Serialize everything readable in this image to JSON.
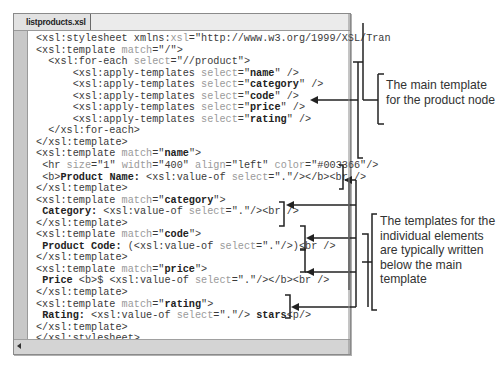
{
  "window": {
    "tab_label": "listproducts.xsl"
  },
  "code_lines": [
    {
      "indent": 0,
      "parts": [
        [
          "t",
          "<xsl:stylesheet xmlns:"
        ],
        [
          "a",
          "xsl"
        ],
        [
          "t",
          "=\"http://www.w3.org/1999/XSL/Tran"
        ]
      ]
    },
    {
      "indent": 0,
      "parts": [
        [
          "t",
          "<xsl:template "
        ],
        [
          "a",
          "match"
        ],
        [
          "t",
          "=\"/\">"
        ]
      ]
    },
    {
      "indent": 2,
      "parts": [
        [
          "t",
          "<xsl:for-each "
        ],
        [
          "a",
          "select"
        ],
        [
          "t",
          "=\"//product\">"
        ]
      ]
    },
    {
      "indent": 6,
      "parts": [
        [
          "t",
          "<xsl:apply-templates "
        ],
        [
          "a",
          "select"
        ],
        [
          "t",
          "=\""
        ],
        [
          "b",
          "name"
        ],
        [
          "t",
          "\" />"
        ]
      ]
    },
    {
      "indent": 6,
      "parts": [
        [
          "t",
          "<xsl:apply-templates "
        ],
        [
          "a",
          "select"
        ],
        [
          "t",
          "=\""
        ],
        [
          "b",
          "category"
        ],
        [
          "t",
          "\" />"
        ]
      ]
    },
    {
      "indent": 6,
      "parts": [
        [
          "t",
          "<xsl:apply-templates "
        ],
        [
          "a",
          "select"
        ],
        [
          "t",
          "=\""
        ],
        [
          "b",
          "code"
        ],
        [
          "t",
          "\" />"
        ]
      ]
    },
    {
      "indent": 6,
      "parts": [
        [
          "t",
          "<xsl:apply-templates "
        ],
        [
          "a",
          "select"
        ],
        [
          "t",
          "=\""
        ],
        [
          "b",
          "price"
        ],
        [
          "t",
          "\" />"
        ]
      ]
    },
    {
      "indent": 6,
      "parts": [
        [
          "t",
          "<xsl:apply-templates "
        ],
        [
          "a",
          "select"
        ],
        [
          "t",
          "=\""
        ],
        [
          "b",
          "rating"
        ],
        [
          "t",
          "\" />"
        ]
      ]
    },
    {
      "indent": 2,
      "parts": [
        [
          "t",
          "</xsl:for-each>"
        ]
      ]
    },
    {
      "indent": 0,
      "parts": [
        [
          "t",
          "</xsl:template>"
        ]
      ]
    },
    {
      "indent": 0,
      "parts": [
        [
          "t",
          "<xsl:template "
        ],
        [
          "a",
          "match"
        ],
        [
          "t",
          "=\""
        ],
        [
          "b",
          "name"
        ],
        [
          "t",
          "\">"
        ]
      ]
    },
    {
      "indent": 1,
      "parts": [
        [
          "t",
          "<hr "
        ],
        [
          "a",
          "size"
        ],
        [
          "t",
          "=\"1\" "
        ],
        [
          "a",
          "width"
        ],
        [
          "t",
          "=\"400\" "
        ],
        [
          "a",
          "align"
        ],
        [
          "t",
          "=\"left\" "
        ],
        [
          "a",
          "color"
        ],
        [
          "t",
          "=\"#003366\"/>"
        ]
      ]
    },
    {
      "indent": 1,
      "parts": [
        [
          "t",
          "<b>"
        ],
        [
          "b",
          "Product Name: "
        ],
        [
          "t",
          "<xsl:value-of "
        ],
        [
          "a",
          "select"
        ],
        [
          "t",
          "=\".\"/></b><br />"
        ]
      ]
    },
    {
      "indent": 0,
      "parts": [
        [
          "t",
          "</xsl:template>"
        ]
      ]
    },
    {
      "indent": 0,
      "parts": [
        [
          "t",
          "<xsl:template "
        ],
        [
          "a",
          "match"
        ],
        [
          "t",
          "=\""
        ],
        [
          "b",
          "category"
        ],
        [
          "t",
          "\">"
        ]
      ]
    },
    {
      "indent": 1,
      "parts": [
        [
          "b",
          "Category: "
        ],
        [
          "t",
          "<xsl:value-of "
        ],
        [
          "a",
          "select"
        ],
        [
          "t",
          "=\".\"/><br />"
        ]
      ]
    },
    {
      "indent": 0,
      "parts": [
        [
          "t",
          "</xsl:template>"
        ]
      ]
    },
    {
      "indent": 0,
      "parts": [
        [
          "t",
          "<xsl:template "
        ],
        [
          "a",
          "match"
        ],
        [
          "t",
          "=\""
        ],
        [
          "b",
          "code"
        ],
        [
          "t",
          "\">"
        ]
      ]
    },
    {
      "indent": 1,
      "parts": [
        [
          "b",
          "Product Code: "
        ],
        [
          "t",
          "(<xsl:value-of "
        ],
        [
          "a",
          "select"
        ],
        [
          "t",
          "=\".\"/>)<br />"
        ]
      ]
    },
    {
      "indent": 0,
      "parts": [
        [
          "t",
          "</xsl:template>"
        ]
      ]
    },
    {
      "indent": 0,
      "parts": [
        [
          "t",
          "<xsl:template "
        ],
        [
          "a",
          "match"
        ],
        [
          "t",
          "=\""
        ],
        [
          "b",
          "price"
        ],
        [
          "t",
          "\">"
        ]
      ]
    },
    {
      "indent": 1,
      "parts": [
        [
          "b",
          "Price "
        ],
        [
          "t",
          "<b>$ <xsl:value-of "
        ],
        [
          "a",
          "select"
        ],
        [
          "t",
          "=\".\"/></b><br />"
        ]
      ]
    },
    {
      "indent": 0,
      "parts": [
        [
          "t",
          "</xsl:template>"
        ]
      ]
    },
    {
      "indent": 0,
      "parts": [
        [
          "t",
          "<xsl:template "
        ],
        [
          "a",
          "match"
        ],
        [
          "t",
          "=\""
        ],
        [
          "b",
          "rating"
        ],
        [
          "t",
          "\">"
        ]
      ]
    },
    {
      "indent": 1,
      "parts": [
        [
          "b",
          "Rating: "
        ],
        [
          "t",
          "<xsl:value-of "
        ],
        [
          "a",
          "select"
        ],
        [
          "t",
          "=\".\"/> "
        ],
        [
          "b",
          "stars"
        ],
        [
          "t",
          "<p/>"
        ]
      ]
    },
    {
      "indent": 0,
      "parts": [
        [
          "t",
          "</xsl:template>"
        ]
      ]
    },
    {
      "indent": 0,
      "parts": [
        [
          "t",
          "</xsl:stylesheet>"
        ]
      ]
    }
  ],
  "callouts": {
    "main_template": "The main template for the product node",
    "individual_templates": "The templates for the individual elements are typically written below the main template"
  },
  "icons": {
    "scroll_left": "scroll-left-arrow-icon"
  }
}
